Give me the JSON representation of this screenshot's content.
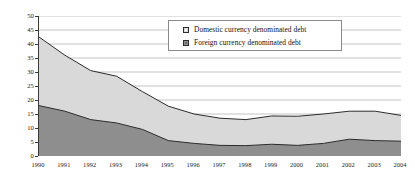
{
  "chart_data": {
    "type": "area",
    "stacked": true,
    "title": "",
    "subtitle": "",
    "xlabel": "",
    "ylabel": "",
    "categories": [
      "1990",
      "1991",
      "1992",
      "1993",
      "1994",
      "1995",
      "1996",
      "1997",
      "1998",
      "1999",
      "2000",
      "2001",
      "2002",
      "2003",
      "2004"
    ],
    "x": [
      1990,
      1991,
      1992,
      1993,
      1994,
      1995,
      1996,
      1997,
      1998,
      1999,
      2000,
      2001,
      2002,
      2003,
      2004
    ],
    "series": [
      {
        "name": "Foreign currency denominated debt",
        "color": "#8e8e8e",
        "values": [
          18.0,
          16.0,
          13.0,
          11.8,
          9.5,
          5.5,
          4.5,
          3.8,
          3.7,
          4.2,
          3.8,
          4.5,
          6.0,
          5.5,
          5.3
        ]
      },
      {
        "name": "Domestic currency denominated debt",
        "color": "#d9d9d9",
        "values": [
          24.5,
          20.0,
          17.5,
          16.7,
          13.5,
          12.3,
          10.5,
          9.7,
          9.3,
          10.1,
          10.4,
          10.5,
          10.0,
          10.5,
          9.2
        ]
      }
    ],
    "totals": [
      42.5,
      36.0,
      30.5,
      28.5,
      23.0,
      17.8,
      15.0,
      13.5,
      13.0,
      14.3,
      14.2,
      15.0,
      16.0,
      16.0,
      14.5
    ],
    "ylim": [
      0,
      50
    ],
    "ytick_values": [
      0,
      5,
      10,
      15,
      20,
      25,
      30,
      35,
      40,
      45,
      50
    ],
    "ytick_labels": [
      "0",
      "5",
      "10",
      "15",
      "20",
      "25",
      "30",
      "35",
      "40",
      "45",
      "50"
    ],
    "grid": "horizontal",
    "legend_position": "top-center"
  },
  "legend": {
    "items": [
      {
        "label": "Domestic currency denominated debt",
        "swatch": "domestic-swatch-icon"
      },
      {
        "label": "Foreign currency denominated debt",
        "swatch": "foreign-swatch-icon"
      }
    ]
  },
  "colors": {
    "domestic_fill": "#d9d9d9",
    "foreign_fill": "#8e8e8e",
    "line": "#2b2b2b",
    "grid": "#9a9a9a",
    "axis": "#3a3a3a",
    "text": "#1a1a1a",
    "background": "#ffffff"
  }
}
